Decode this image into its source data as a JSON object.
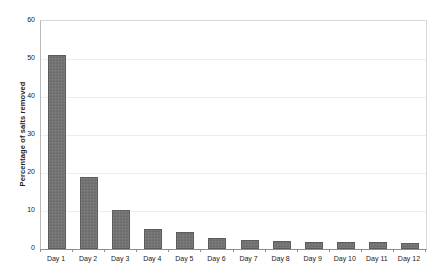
{
  "chart_data": {
    "type": "bar",
    "title": "",
    "xlabel": "",
    "ylabel": "Percentage of salts removed",
    "categories": [
      "Day 1",
      "Day 2",
      "Day 3",
      "Day 4",
      "Day 5",
      "Day 6",
      "Day 7",
      "Day 8",
      "Day 9",
      "Day 10",
      "Day 11",
      "Day 12"
    ],
    "values": [
      51,
      19,
      10.3,
      5.3,
      4.4,
      2.9,
      2.4,
      2.1,
      1.9,
      1.8,
      1.9,
      1.5
    ],
    "ylim": [
      0,
      60
    ],
    "yticks": [
      0,
      10,
      20,
      30,
      40,
      50,
      60
    ],
    "ytick_labels": [
      "0",
      "10",
      "20",
      "30",
      "40",
      "50",
      "60"
    ],
    "grid": true,
    "legend": false,
    "legend_position": "none",
    "bar_color": "#6e6e6e",
    "gridline_color": "#ededed",
    "axis_color": "#8f8f8f",
    "background_color": "#ffffff"
  }
}
